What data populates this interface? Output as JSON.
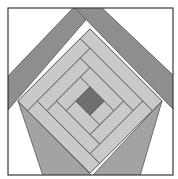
{
  "diagram": {
    "colors": {
      "background": "#ffffff",
      "frame": "#3a3a3a",
      "roof_band": "#8e8e8e",
      "wall_triangle": "#a3a3a3",
      "log": "#c9c9c9",
      "seam": "#555555",
      "center": "#6f6f6f"
    }
  }
}
